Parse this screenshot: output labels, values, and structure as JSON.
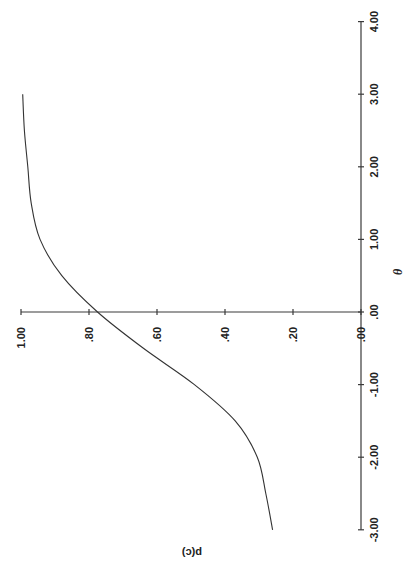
{
  "chart_data": {
    "type": "line",
    "title": "",
    "rotation_note": "figure rendered rotated 90 degrees counterclockwise",
    "xlabel": "θ",
    "ylabel": "p(c)",
    "xlim": [
      -3.0,
      4.0
    ],
    "ylim": [
      0.0,
      1.0
    ],
    "x_ticks": [
      "-3.00",
      "-2.00",
      "-1.00",
      ".00",
      "1.00",
      "2.00",
      "3.00",
      "4.00"
    ],
    "y_ticks": [
      ".00",
      ".20",
      ".40",
      ".60",
      ".80",
      "1.00"
    ],
    "grid": false,
    "legend": null,
    "series": [
      {
        "name": "ICC",
        "x": [
          -3.0,
          -2.5,
          -2.0,
          -1.5,
          -1.0,
          -0.5,
          0.0,
          0.5,
          1.0,
          1.5,
          2.0,
          2.5,
          3.0
        ],
        "y": [
          0.26,
          0.28,
          0.305,
          0.37,
          0.49,
          0.64,
          0.775,
          0.88,
          0.944,
          0.97,
          0.98,
          0.99,
          0.995
        ]
      }
    ]
  },
  "axes": {
    "theta_label": "θ",
    "p_label": "p(c)"
  }
}
